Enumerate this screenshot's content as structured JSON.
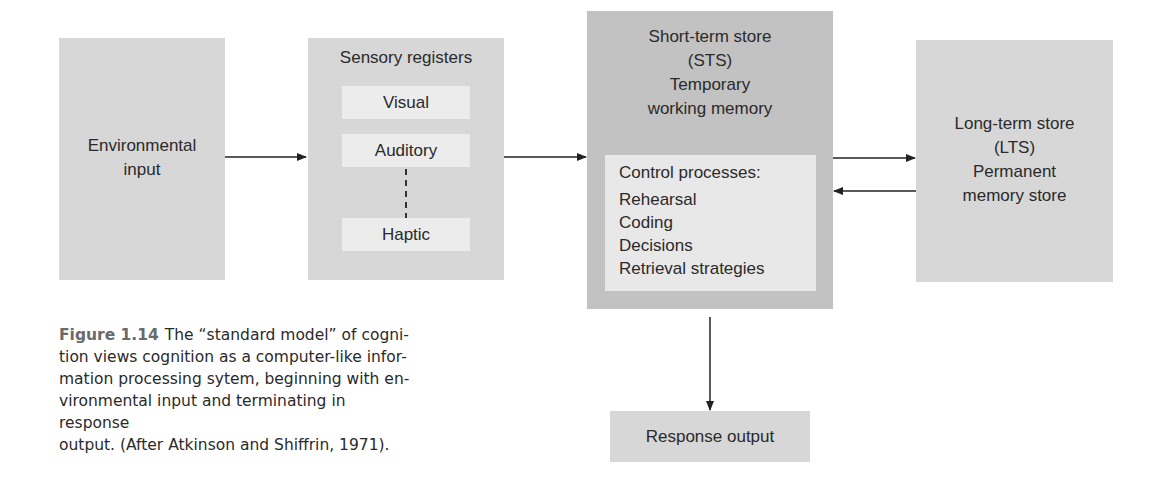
{
  "nodes": {
    "environmental_input": {
      "lines": [
        "Environmental",
        "input"
      ]
    },
    "sensory_registers": {
      "title": "Sensory registers",
      "items": [
        "Visual",
        "Auditory",
        "Haptic"
      ]
    },
    "short_term_store": {
      "lines": [
        "Short-term store",
        "(STS)",
        "Temporary",
        "working memory"
      ],
      "control_title": "Control processes:",
      "control_items": [
        "Rehearsal",
        "Coding",
        "Decisions",
        "Retrieval strategies"
      ]
    },
    "long_term_store": {
      "lines": [
        "Long-term store",
        "(LTS)",
        "Permanent",
        "memory store"
      ]
    },
    "response_output": {
      "label": "Response output"
    }
  },
  "edges": [
    {
      "from": "environmental_input",
      "to": "sensory_registers"
    },
    {
      "from": "sensory_registers",
      "to": "short_term_store"
    },
    {
      "from": "short_term_store",
      "to": "long_term_store"
    },
    {
      "from": "long_term_store",
      "to": "short_term_store"
    },
    {
      "from": "short_term_store",
      "to": "response_output"
    }
  ],
  "caption": {
    "figure_label": "Figure 1.14",
    "lines": [
      "The “standard model” of cogni-",
      "tion views cognition as a computer-like infor-",
      "mation processing sytem, beginning with en-",
      "vironmental input and terminating in response",
      "output. (After Atkinson and Shiffrin, 1971)."
    ]
  }
}
